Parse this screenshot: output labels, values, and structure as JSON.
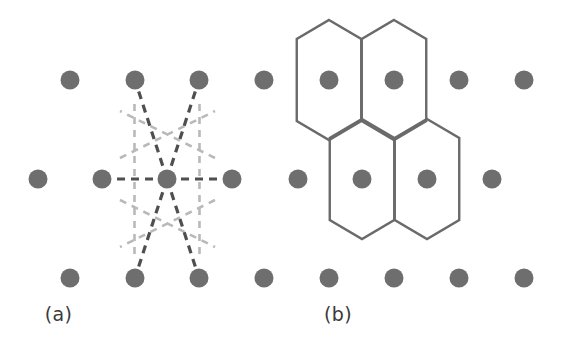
{
  "figure": {
    "width": 563,
    "height": 356,
    "background": "#ffffff",
    "panels": [
      {
        "id": "a",
        "caption": "(a)"
      },
      {
        "id": "b",
        "caption": "(b)"
      }
    ]
  },
  "colors": {
    "lattice_dot": "#6e6e6e",
    "bond_dashed_dark": "#4f4f4f",
    "bisector_dashed_light": "#b9b9b9",
    "hexagon_stroke": "#6a6a6a",
    "caption_text": "#3a3a3a",
    "background": "#ffffff"
  },
  "geometry": {
    "dot_radius": 9.5,
    "lattice_a": 64.5,
    "row_spacing": 99,
    "row_offset_x": 32.25,
    "hexagon": {
      "half_width": 32.25,
      "side_vertical_length": 82,
      "total_height": 120
    }
  },
  "panel_a": {
    "label": "(a)",
    "description": "Two-dimensional lattice with nearest-neighbour bonds and perpendicular bisectors",
    "dots": [
      {
        "x": 70,
        "y": 80
      },
      {
        "x": 135,
        "y": 80
      },
      {
        "x": 199,
        "y": 80
      },
      {
        "x": 264,
        "y": 80
      },
      {
        "x": 38,
        "y": 179
      },
      {
        "x": 102,
        "y": 179
      },
      {
        "x": 167,
        "y": 179
      },
      {
        "x": 232,
        "y": 179
      },
      {
        "x": 70,
        "y": 278
      },
      {
        "x": 135,
        "y": 278
      },
      {
        "x": 199,
        "y": 278
      },
      {
        "x": 264,
        "y": 278
      }
    ],
    "center_dot": {
      "x": 167,
      "y": 179
    },
    "bonds_dark": [
      {
        "x1": 167,
        "y1": 179,
        "x2": 102,
        "y2": 179
      },
      {
        "x1": 167,
        "y1": 179,
        "x2": 232,
        "y2": 179
      },
      {
        "x1": 167,
        "y1": 179,
        "x2": 135,
        "y2": 80
      },
      {
        "x1": 167,
        "y1": 179,
        "x2": 199,
        "y2": 80
      },
      {
        "x1": 167,
        "y1": 179,
        "x2": 135,
        "y2": 278
      },
      {
        "x1": 167,
        "y1": 179,
        "x2": 199,
        "y2": 278
      }
    ],
    "bisectors_light": [
      {
        "x1": 134.5,
        "y1": 104,
        "x2": 134.5,
        "y2": 254
      },
      {
        "x1": 199.5,
        "y1": 104,
        "x2": 199.5,
        "y2": 254
      },
      {
        "x1": 120,
        "y1": 158,
        "x2": 215,
        "y2": 111
      },
      {
        "x1": 120,
        "y1": 200,
        "x2": 215,
        "y2": 247
      },
      {
        "x1": 215,
        "y1": 158,
        "x2": 120,
        "y2": 111
      },
      {
        "x1": 215,
        "y1": 200,
        "x2": 120,
        "y2": 247
      }
    ]
  },
  "panel_b": {
    "label": "(b)",
    "description": "Resulting Wigner-Seitz hexagonal cells drawn around four lattice points",
    "dots": [
      {
        "x": 48,
        "y": 80
      },
      {
        "x": 113,
        "y": 80
      },
      {
        "x": 178,
        "y": 80
      },
      {
        "x": 243,
        "y": 80
      },
      {
        "x": 17,
        "y": 179
      },
      {
        "x": 81,
        "y": 179
      },
      {
        "x": 146,
        "y": 179
      },
      {
        "x": 211,
        "y": 179
      },
      {
        "x": 48,
        "y": 278
      },
      {
        "x": 113,
        "y": 278
      },
      {
        "x": 178,
        "y": 278
      },
      {
        "x": 243,
        "y": 278
      }
    ],
    "hexagon_centers": [
      {
        "x": 48,
        "y": 80
      },
      {
        "x": 113,
        "y": 80
      },
      {
        "x": 81,
        "y": 179
      },
      {
        "x": 146,
        "y": 179
      }
    ]
  }
}
